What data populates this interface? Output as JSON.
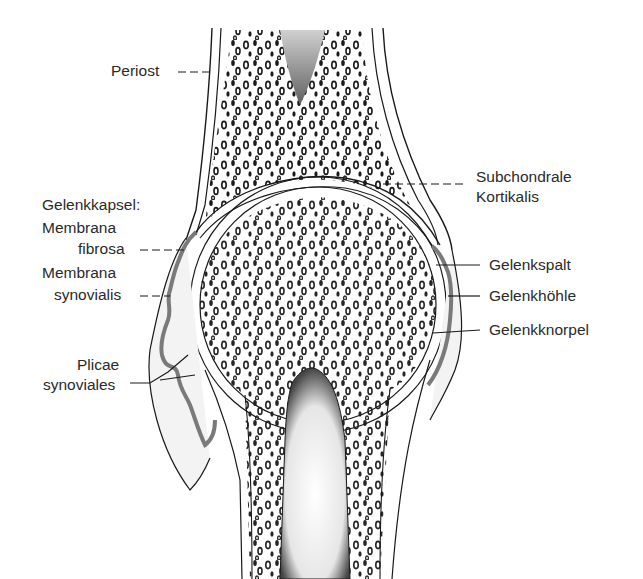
{
  "diagram": {
    "type": "anatomical-illustration",
    "colors": {
      "ink": "#1a1a1a",
      "synovial_membrane": "#7a7a7a",
      "cartilage_fill": "#ececec",
      "background": "#ffffff"
    }
  },
  "labels": {
    "periost": "Periost",
    "gelenkkapsel": "Gelenkkapsel:",
    "membrana_fibrosa_line1": "Membrana",
    "membrana_fibrosa_line2": "fibrosa",
    "membrana_synovialis_line1": "Membrana",
    "membrana_synovialis_line2": "synovialis",
    "plicae_line1": "Plicae",
    "plicae_line2": "synoviales",
    "subchondrale_line1": "Subchondrale",
    "subchondrale_line2": "Kortikalis",
    "gelenkspalt": "Gelenkspalt",
    "gelenkhoehle": "Gelenkhöhle",
    "gelenkknorpel": "Gelenkknorpel"
  }
}
